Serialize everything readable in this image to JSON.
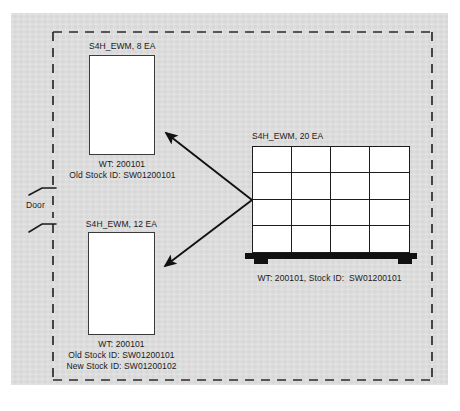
{
  "diagram": {
    "background_color": "#ffffff",
    "plate_color": "#dcdcdc",
    "line_color": "#1a1a1a",
    "boundary_style": "dashed",
    "door": {
      "label": "Door",
      "position": "left wall"
    },
    "boxes": [
      {
        "id": "box-top",
        "title": "S4H_EWM, 8 EA",
        "material": "S4H_EWM",
        "quantity": 8,
        "unit": "EA",
        "lines": [
          "WT: 200101",
          "Old Stock ID: SW01200101"
        ],
        "wt": "WT: 200101",
        "old_stock_id": "Old Stock ID: SW01200101"
      },
      {
        "id": "box-bottom",
        "title": "S4H_EWM, 12 EA",
        "material": "S4H_EWM",
        "quantity": 12,
        "unit": "EA",
        "lines": [
          "WT: 200101",
          "Old Stock ID: SW01200101",
          "New Stock ID: SW01200102"
        ],
        "wt": "WT: 200101",
        "old_stock_id": "Old Stock ID: SW01200101",
        "new_stock_id": "New Stock ID: SW01200102"
      }
    ],
    "pallet": {
      "id": "pallet",
      "title": "S4H_EWM, 20 EA",
      "material": "S4H_EWM",
      "quantity": 20,
      "unit": "EA",
      "caption": "WT: 200101, Stock ID:  SW01200101",
      "grid_columns": 4,
      "grid_rows": 4,
      "base_color": "#111111"
    },
    "arrows": [
      {
        "id": "arrow-to-box-top",
        "from": "pallet",
        "to": "box-top",
        "direction": "up-left"
      },
      {
        "id": "arrow-to-box-bottom",
        "from": "pallet",
        "to": "box-bottom",
        "direction": "down-left"
      }
    ],
    "footer_caption": ""
  }
}
